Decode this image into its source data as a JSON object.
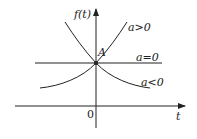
{
  "diagram": {
    "y_axis_label": "f(t)",
    "x_axis_label": "t",
    "origin_label": "0",
    "point_label": "A",
    "curves": [
      {
        "label": "a>0",
        "shape": "increasing exponential"
      },
      {
        "label": "a=0",
        "shape": "horizontal line"
      },
      {
        "label": "a<0",
        "shape": "decreasing exponential"
      }
    ]
  },
  "colors": {
    "line": "#222222",
    "background": "#ffffff"
  }
}
